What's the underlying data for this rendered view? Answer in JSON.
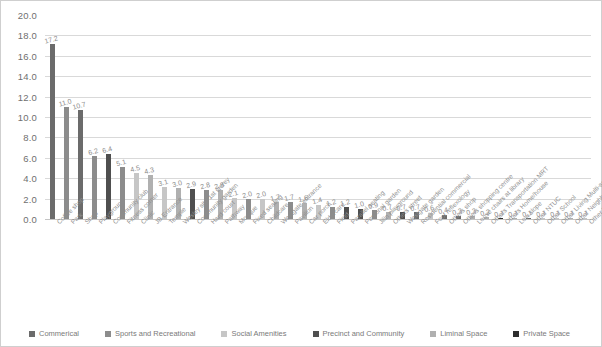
{
  "chart_data": {
    "type": "bar",
    "title": "",
    "xlabel": "",
    "ylabel": "",
    "ylim": [
      0.0,
      20.0
    ],
    "ytick_labels": [
      "20.0",
      "18.0",
      "16.0",
      "14.0",
      "12.0",
      "10.0",
      "8.0",
      "6.0",
      "4.0",
      "2.0",
      "0.0"
    ],
    "ytick_values": [
      20.0,
      18.0,
      16.0,
      14.0,
      12.0,
      10.0,
      8.0,
      6.0,
      4.0,
      2.0,
      0.0
    ],
    "grid": true,
    "legend_position": "bottom-left",
    "categories": [
      "Coffee shop",
      "Park",
      "Shop",
      "Playground",
      "Community club",
      "Fitness corner",
      "Clinic",
      "JB Entrance",
      "Temple",
      "Wesley site 1st storey",
      "Community garden",
      "Hard court",
      "Pathway",
      "Mosque",
      "Fixed seating",
      "Childcare",
      "Westgate entrance",
      "Pavilion",
      "Car porch",
      "Eldercare",
      "Field",
      "Parallel seating",
      "Personal garden",
      "Jilin playground",
      "Others street",
      "Westgate garden",
      "Residential commercial",
      "Foot reflexology",
      "Others shop",
      "Others shopping centre",
      "Loose chairs at library",
      "Others Transportation MRT",
      "Others Home/house",
      "Low slope",
      "Other NTUC",
      "Other School",
      "Other Living Multi-service centre",
      "Other Neighbourhood nearby",
      "Other Library"
    ],
    "values": [
      17.2,
      11.0,
      10.7,
      6.2,
      6.4,
      5.1,
      4.5,
      4.3,
      3.1,
      3.0,
      2.9,
      2.8,
      2.8,
      2.1,
      2.0,
      2.0,
      1.7,
      1.7,
      1.6,
      1.4,
      1.2,
      1.2,
      1.0,
      0.9,
      0.7,
      0.7,
      0.7,
      0.6,
      0.4,
      0.3,
      0.3,
      0.2,
      0.1,
      0.1,
      0.1,
      0.1,
      0.1,
      0.1,
      0.1
    ],
    "value_labels": [
      "17.2",
      "11.0",
      "10.7",
      "6.2",
      "6.4",
      "5.1",
      "4.5",
      "4.3",
      "3.1",
      "3.0",
      "2.9",
      "2.8",
      "2.8",
      "2.1",
      "2.0",
      "2.0",
      "1.7",
      "1.7",
      "1.6",
      "1.4",
      "1.2",
      "1.2",
      "1.0",
      "0.9",
      "0.7",
      "0.7",
      "0.7",
      "0.6",
      "0.4",
      "0.3",
      "0.3",
      "0.2",
      "0.1",
      "0.1",
      "0.1",
      "0.1",
      "0.1",
      "0.1",
      "0.1"
    ],
    "bar_category_index": [
      0,
      1,
      0,
      1,
      3,
      1,
      2,
      4,
      2,
      4,
      3,
      1,
      4,
      2,
      1,
      2,
      4,
      1,
      4,
      2,
      1,
      3,
      3,
      1,
      4,
      3,
      0,
      2,
      0,
      0,
      4,
      4,
      5,
      4,
      0,
      2,
      2,
      4,
      2
    ],
    "series_names": [
      "Commerical",
      "Sports and Recreational",
      "Social Amenities",
      "Precinct and Community",
      "Liminal Space",
      "Private Space"
    ],
    "series_colors": [
      "#6b6b6b",
      "#8c8c8c",
      "#c6c6c6",
      "#4f4f4f",
      "#b0b0b0",
      "#2e2e2e"
    ]
  },
  "legend": {
    "items": [
      {
        "label": "Commerical",
        "color": "#6b6b6b"
      },
      {
        "label": "Sports and Recreational",
        "color": "#8c8c8c"
      },
      {
        "label": "Social Amenities",
        "color": "#c6c6c6"
      },
      {
        "label": "Precinct and Community",
        "color": "#4f4f4f"
      },
      {
        "label": "Liminal Space",
        "color": "#b0b0b0"
      },
      {
        "label": "Private Space",
        "color": "#2e2e2e"
      }
    ]
  }
}
